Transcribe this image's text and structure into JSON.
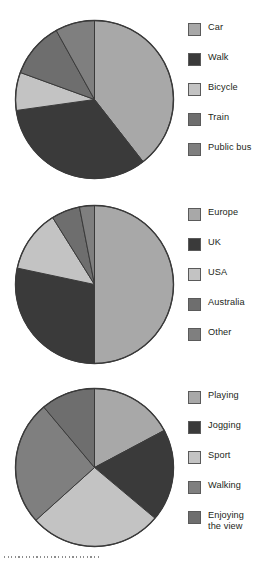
{
  "page": {
    "background": "#ffffff",
    "dotted_rule": "·······························"
  },
  "palette": {
    "slice_light": "#a8a8a8",
    "slice_dark": "#3a3a3a",
    "slice_lightest": "#c3c3c3",
    "slice_medium_dark": "#6e6e6e",
    "slice_medium": "#7f7f7f",
    "outline": "#3a3a3a",
    "text": "#231f20"
  },
  "chart_data": [
    {
      "type": "pie",
      "title": "",
      "id": "transport",
      "legend_position": "right",
      "start_angle_deg": 0,
      "direction": "clockwise",
      "labels": [
        "Car",
        "Walk",
        "Bicycle",
        "Train",
        "Public bus"
      ],
      "angles_deg": [
        142,
        120,
        28,
        41,
        29
      ],
      "values_pct": [
        39.4,
        33.3,
        7.8,
        11.4,
        8.1
      ],
      "colors": [
        "#a8a8a8",
        "#3a3a3a",
        "#c3c3c3",
        "#6e6e6e",
        "#7f7f7f"
      ]
    },
    {
      "type": "pie",
      "title": "",
      "id": "origin",
      "legend_position": "right",
      "start_angle_deg": 0,
      "direction": "clockwise",
      "labels": [
        "Europe",
        "UK",
        "USA",
        "Australia",
        "Other"
      ],
      "angles_deg": [
        180,
        102,
        46,
        21,
        11
      ],
      "values_pct": [
        50.0,
        28.3,
        12.8,
        5.8,
        3.1
      ],
      "colors": [
        "#a8a8a8",
        "#3a3a3a",
        "#c3c3c3",
        "#6e6e6e",
        "#7f7f7f"
      ]
    },
    {
      "type": "pie",
      "title": "",
      "id": "activity",
      "legend_position": "right",
      "start_angle_deg": 0,
      "direction": "clockwise",
      "labels": [
        "Playing",
        "Jogging",
        "Sport",
        "Walking",
        "Enjoying\nthe view"
      ],
      "angles_deg": [
        62,
        68,
        98,
        92,
        40
      ],
      "values_pct": [
        17.2,
        18.9,
        27.2,
        25.6,
        11.1
      ],
      "colors": [
        "#a8a8a8",
        "#3a3a3a",
        "#c3c3c3",
        "#7f7f7f",
        "#6e6e6e"
      ]
    }
  ]
}
